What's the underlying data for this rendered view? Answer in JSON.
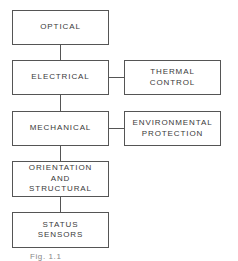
{
  "diagram": {
    "type": "block-diagram",
    "main_column": [
      {
        "id": "optical",
        "lines": [
          "OPTICAL"
        ]
      },
      {
        "id": "electrical",
        "lines": [
          "ELECTRICAL"
        ]
      },
      {
        "id": "mechanical",
        "lines": [
          "MECHANICAL"
        ]
      },
      {
        "id": "orientation",
        "lines": [
          "ORIENTATION",
          "AND",
          "STRUCTURAL"
        ]
      },
      {
        "id": "status",
        "lines": [
          "STATUS",
          "SENSORS"
        ]
      }
    ],
    "side_column": [
      {
        "id": "thermal",
        "attached_to": "electrical",
        "lines": [
          "THERMAL",
          "CONTROL"
        ]
      },
      {
        "id": "environmental",
        "attached_to": "mechanical",
        "lines": [
          "ENVIRONMENTAL",
          "PROTECTION"
        ]
      }
    ],
    "connections": [
      [
        "optical",
        "electrical"
      ],
      [
        "electrical",
        "mechanical"
      ],
      [
        "mechanical",
        "orientation"
      ],
      [
        "orientation",
        "status"
      ],
      [
        "electrical",
        "thermal"
      ],
      [
        "mechanical",
        "environmental"
      ]
    ],
    "caption": "Fig. 1.1"
  }
}
